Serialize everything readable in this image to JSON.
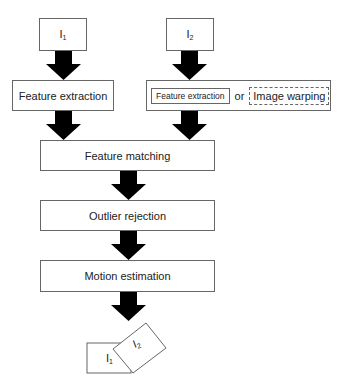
{
  "inputs": {
    "left": {
      "base": "I",
      "sub": "1"
    },
    "right": {
      "base": "I",
      "sub": "2"
    }
  },
  "left_branch": {
    "label": "Feature extraction"
  },
  "right_branch": {
    "option_a": "Feature extraction",
    "connector": "or",
    "option_b": "Image warping"
  },
  "steps": [
    {
      "label": "Feature matching"
    },
    {
      "label": "Outlier rejection"
    },
    {
      "label": "Motion estimation"
    }
  ],
  "output": {
    "image1": {
      "base": "I",
      "sub": "1"
    },
    "image2": {
      "base": "I",
      "sub": "2"
    }
  },
  "colors": {
    "arrow": "#000000",
    "border": "#666666",
    "text": "#222222"
  }
}
